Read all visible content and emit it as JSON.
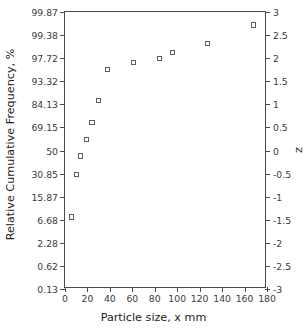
{
  "chart_data": {
    "type": "scatter",
    "title": "",
    "xlabel": "Particle size, x mm",
    "ylabel": "Relative Cumulative Frequency, %",
    "y2label": "z",
    "xlim": [
      0,
      180
    ],
    "ylim": [
      -3,
      3
    ],
    "y2lim": [
      -3,
      3
    ],
    "grid": false,
    "legend": null,
    "xticks": [
      0,
      20,
      40,
      60,
      80,
      100,
      120,
      140,
      160,
      180
    ],
    "xticklabels": [
      "0",
      "20",
      "40",
      "60",
      "80",
      "100",
      "120",
      "140",
      "160",
      "180"
    ],
    "yticks_z": [
      3,
      2.5,
      2,
      1.5,
      1,
      0.5,
      0,
      -0.5,
      -1,
      -1.5,
      -2,
      -2.5,
      -3
    ],
    "yticklabels_percent": [
      "99.87",
      "99.38",
      "97.72",
      "93.32",
      "84.13",
      "69.15",
      "50",
      "30.85",
      "15.87",
      "6.68",
      "2.28",
      "0.62",
      "0.13"
    ],
    "y2ticks": [
      3,
      2.5,
      2,
      1.5,
      1,
      0.5,
      0,
      -0.5,
      -1,
      -1.5,
      -2,
      -2.5,
      -3
    ],
    "y2ticklabels": [
      "3",
      "2.5",
      "2",
      "1.5",
      "1",
      "0.5",
      "0",
      "-0.5",
      "-1",
      "-1.5",
      "-2",
      "-2.5",
      "-3"
    ],
    "series": [
      {
        "name": "Cumulative size distribution",
        "marker": "open-square",
        "color": "#5d5d5d",
        "points": [
          {
            "x": 6,
            "z": -1.44,
            "percent": 7.5
          },
          {
            "x": 10,
            "z": -0.52,
            "percent": 30.2
          },
          {
            "x": 14,
            "z": -0.12,
            "percent": 45.2
          },
          {
            "x": 19,
            "z": 0.23,
            "percent": 59.1
          },
          {
            "x": 24,
            "z": 0.61,
            "percent": 72.9
          },
          {
            "x": 30,
            "z": 1.08,
            "percent": 86.0
          },
          {
            "x": 38,
            "z": 1.75,
            "percent": 96.0
          },
          {
            "x": 61,
            "z": 1.91,
            "percent": 97.2
          },
          {
            "x": 84,
            "z": 2.0,
            "percent": 97.7
          },
          {
            "x": 96,
            "z": 2.12,
            "percent": 98.3
          },
          {
            "x": 127,
            "z": 2.32,
            "percent": 99.0
          },
          {
            "x": 168,
            "z": 2.72,
            "percent": 99.7
          }
        ]
      }
    ]
  },
  "axes": {
    "x_title": "Particle size, x mm",
    "y_title": "Relative Cumulative Frequency, %",
    "y2_title": "z"
  }
}
